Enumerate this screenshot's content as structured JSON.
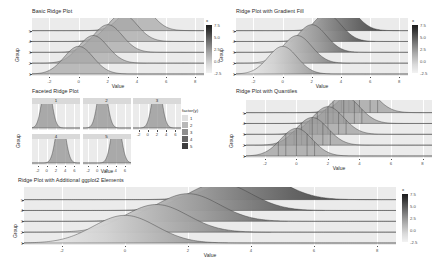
{
  "figure": {
    "background": "#ffffff",
    "panel_background": "#ebebeb",
    "grid_color": "#ffffff",
    "text_color": "#4d4d4d"
  },
  "chart_data": [
    {
      "id": "basic",
      "type": "area",
      "title": "Basic Ridge Plot",
      "xlabel": "Value",
      "ylabel": "Group",
      "xlim": [
        -3.2,
        8.6
      ],
      "xticks": [
        "-2",
        "0",
        "2",
        "4",
        "6",
        "8"
      ],
      "xtick_values": [
        -2,
        0,
        2,
        4,
        6,
        8
      ],
      "yticks": [
        "1",
        "2",
        "3",
        "4",
        "5"
      ],
      "grid": true,
      "legend": {
        "position": "right",
        "title": "x",
        "ticks": [
          "7.5",
          "5.0",
          "2.5",
          "0.0",
          "-2.5"
        ],
        "tick_values": [
          7.5,
          5.0,
          2.5,
          0.0,
          -2.5
        ]
      },
      "series": [
        {
          "name": "1",
          "mean": 0.0,
          "sd": 1.0,
          "height": 1.0
        },
        {
          "name": "2",
          "mean": 1.0,
          "sd": 1.0,
          "height": 1.0
        },
        {
          "name": "3",
          "mean": 2.0,
          "sd": 1.0,
          "height": 1.0
        },
        {
          "name": "4",
          "mean": 3.0,
          "sd": 1.0,
          "height": 1.0
        },
        {
          "name": "5",
          "mean": 4.0,
          "sd": 1.0,
          "height": 1.0
        }
      ]
    },
    {
      "id": "gradient",
      "type": "area",
      "title": "Ridge Plot with Gradient Fill",
      "xlabel": "Value",
      "ylabel": "Group",
      "xlim": [
        -3.2,
        8.6
      ],
      "xticks": [
        "-2",
        "0",
        "2",
        "4",
        "6",
        "8"
      ],
      "xtick_values": [
        -2,
        0,
        2,
        4,
        6,
        8
      ],
      "yticks": [
        "1",
        "2",
        "3",
        "4",
        "5"
      ],
      "grid": true,
      "legend": {
        "position": "right",
        "title": "x",
        "ticks": [
          "7.5",
          "5.0",
          "2.5",
          "0.0",
          "-2.5"
        ],
        "tick_values": [
          7.5,
          5.0,
          2.5,
          0.0,
          -2.5
        ]
      },
      "series": [
        {
          "name": "1",
          "mean": 0.0,
          "sd": 1.0,
          "height": 1.0
        },
        {
          "name": "2",
          "mean": 1.0,
          "sd": 1.0,
          "height": 1.0
        },
        {
          "name": "3",
          "mean": 2.0,
          "sd": 1.0,
          "height": 1.0
        },
        {
          "name": "4",
          "mean": 3.0,
          "sd": 1.0,
          "height": 1.0
        },
        {
          "name": "5",
          "mean": 4.0,
          "sd": 1.0,
          "height": 1.0
        }
      ]
    },
    {
      "id": "faceted",
      "type": "area",
      "title": "Faceted Ridge Plot",
      "xlabel": "Value",
      "ylabel": "Group",
      "xlim": [
        -3.2,
        7.2
      ],
      "xticks": [
        "-2",
        "0",
        "2",
        "4",
        "6"
      ],
      "xtick_values": [
        -2,
        0,
        2,
        4,
        6
      ],
      "grid": true,
      "facets": [
        "1",
        "2",
        "3",
        "4",
        "5"
      ],
      "facet_means": [
        0.0,
        1.0,
        2.0,
        3.0,
        4.0
      ],
      "legend": {
        "position": "right",
        "title": "factor(y)",
        "keys": [
          "1",
          "2",
          "3",
          "4",
          "5"
        ]
      }
    },
    {
      "id": "quantiles",
      "type": "area",
      "title": "Ridge Plot with Quantiles",
      "xlabel": "Value",
      "ylabel": "Group",
      "xlim": [
        -3.2,
        8.6
      ],
      "xticks": [
        "-2",
        "0",
        "2",
        "4",
        "6",
        "8"
      ],
      "xtick_values": [
        -2,
        0,
        2,
        4,
        6,
        8
      ],
      "yticks": [
        "1",
        "2",
        "3",
        "4",
        "5"
      ],
      "grid": true,
      "quantiles": 4,
      "series": [
        {
          "name": "1",
          "mean": 0.0,
          "sd": 1.0,
          "height": 1.0
        },
        {
          "name": "2",
          "mean": 1.0,
          "sd": 1.0,
          "height": 1.0
        },
        {
          "name": "3",
          "mean": 2.0,
          "sd": 1.0,
          "height": 1.0
        },
        {
          "name": "4",
          "mean": 3.0,
          "sd": 1.0,
          "height": 1.0
        },
        {
          "name": "5",
          "mean": 4.0,
          "sd": 1.0,
          "height": 1.0
        }
      ]
    },
    {
      "id": "additional",
      "type": "area",
      "title": "Ridge Plot with Additional ggplot2 Elements",
      "xlabel": "Value",
      "ylabel": "Group",
      "xlim": [
        -3.2,
        8.6
      ],
      "xticks": [
        "-2",
        "0",
        "2",
        "4",
        "6",
        "8"
      ],
      "xtick_values": [
        -2,
        0,
        2,
        4,
        6,
        8
      ],
      "yticks": [
        "1",
        "2",
        "3",
        "4",
        "5"
      ],
      "grid": true,
      "legend": {
        "position": "right",
        "title": "x",
        "ticks": [
          "7.5",
          "5.0",
          "2.5",
          "0.0",
          "-2.5"
        ],
        "tick_values": [
          7.5,
          5.0,
          2.5,
          0.0,
          -2.5
        ]
      },
      "series": [
        {
          "name": "1",
          "mean": 0.0,
          "sd": 1.0,
          "height": 1.0
        },
        {
          "name": "2",
          "mean": 1.0,
          "sd": 1.0,
          "height": 1.0
        },
        {
          "name": "3",
          "mean": 2.0,
          "sd": 1.0,
          "height": 1.0
        },
        {
          "name": "4",
          "mean": 3.0,
          "sd": 1.0,
          "height": 1.0
        },
        {
          "name": "5",
          "mean": 4.0,
          "sd": 1.0,
          "height": 1.0
        }
      ]
    }
  ]
}
